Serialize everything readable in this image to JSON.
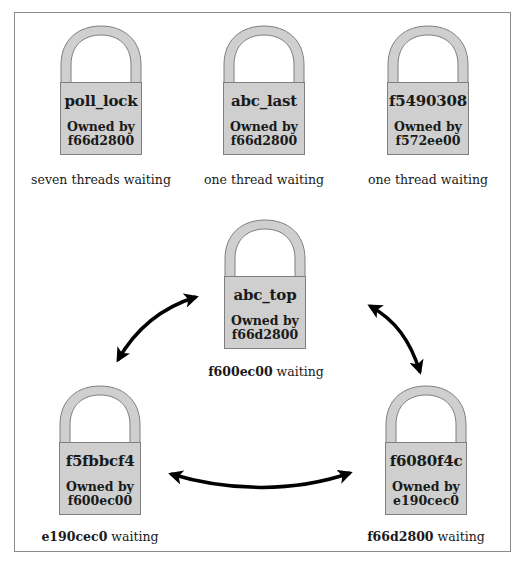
{
  "diagram": {
    "title": "",
    "colors": {
      "lock_fill": "#cfcfcf",
      "lock_border": "#7f7f7f",
      "arrow": "#000000",
      "frame": "#8a8a8a"
    },
    "top_row": [
      {
        "lock_name": "poll_lock",
        "owned_label": "Owned by",
        "owner": "f66d2800",
        "caption": "seven threads waiting"
      },
      {
        "lock_name": "abc_last",
        "owned_label": "Owned by",
        "owner": "f66d2800",
        "caption": "one thread waiting"
      },
      {
        "lock_name": "f5490308",
        "owned_label": "Owned by",
        "owner": "f572ee00",
        "caption": "one thread waiting"
      }
    ],
    "cycle": [
      {
        "lock_name": "abc_top",
        "owned_label": "Owned by",
        "owner": "f66d2800",
        "waiter": "f600ec00",
        "waiting_label": "waiting"
      },
      {
        "lock_name": "f5fbbcf4",
        "owned_label": "Owned by",
        "owner": "f600ec00",
        "waiter": "e190cec0",
        "waiting_label": "waiting"
      },
      {
        "lock_name": "f6080f4c",
        "owned_label": "Owned by",
        "owner": "e190cec0",
        "waiter": "f66d2800",
        "waiting_label": "waiting"
      }
    ],
    "arrows": [
      {
        "from": "f5fbbcf4",
        "to": "abc_top",
        "type": "double-headed"
      },
      {
        "from": "abc_top",
        "to": "f6080f4c",
        "type": "double-headed"
      },
      {
        "from": "f5fbbcf4",
        "to": "f6080f4c",
        "type": "double-headed"
      }
    ]
  }
}
